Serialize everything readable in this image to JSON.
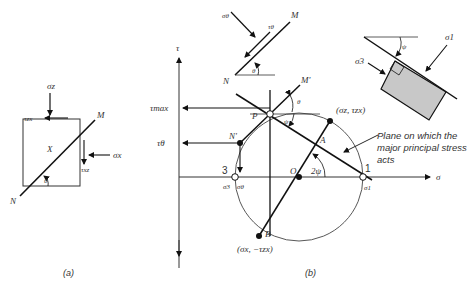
{
  "figure_a": {
    "caption": "(a)",
    "labels": {
      "sigma_z": "σz",
      "sigma_x": "σx",
      "tau_zx": "τzx",
      "tau_xz": "τxz",
      "point_x": "X",
      "theta": "θ",
      "M": "M",
      "N": "N"
    }
  },
  "figure_b": {
    "caption": "(b)",
    "axes": {
      "tau": "τ",
      "sigma": "σ"
    },
    "labels": {
      "tau_max": "τmax",
      "tau_theta": "τθ",
      "P": "P",
      "N_prime": "N'",
      "M_prime": "M'",
      "A": "A",
      "A_coord": "(σz, τzx)",
      "B": "B",
      "B_coord": "(σx, −τzx)",
      "O": "O",
      "two_psi": "2ψ",
      "theta": "θ",
      "psi": "ψ",
      "point_1": "1",
      "point_3": "3",
      "sigma_1": "σ1",
      "sigma_3": "σ3",
      "sigma_theta": "σθ"
    },
    "annotation": "Plane on which the major principal stress acts",
    "annotation_lines": [
      "Plane on which the",
      "major principal stress",
      "acts"
    ],
    "inset_plane": {
      "sigma_theta": "σθ",
      "tau_theta": "τθ",
      "M": "M",
      "N": "N",
      "theta": "θ"
    },
    "inset_element": {
      "sigma_1": "σ1",
      "sigma_3": "σ3",
      "psi": "ψ",
      "fill": "#c8c8c8"
    }
  }
}
